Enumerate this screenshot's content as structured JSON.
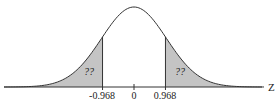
{
  "chart_data": {
    "type": "area",
    "title": "",
    "xlabel": "Z",
    "ylabel": "",
    "x_ticks": [
      "-0.968",
      "0",
      "0.968"
    ],
    "shaded_regions": [
      {
        "name": "left-tail",
        "from": null,
        "to": -0.968,
        "label": "??"
      },
      {
        "name": "right-tail",
        "from": 0.968,
        "to": null,
        "label": "??"
      }
    ],
    "mean": 0,
    "sd": 1,
    "grid": false,
    "colors": {
      "shade": "#c4c4c4",
      "line": "#333333"
    }
  },
  "labels": {
    "axis": "Z",
    "tick_left": "-0.968",
    "tick_center": "0",
    "tick_right": "0.968",
    "left_area": "??",
    "right_area": "??"
  }
}
